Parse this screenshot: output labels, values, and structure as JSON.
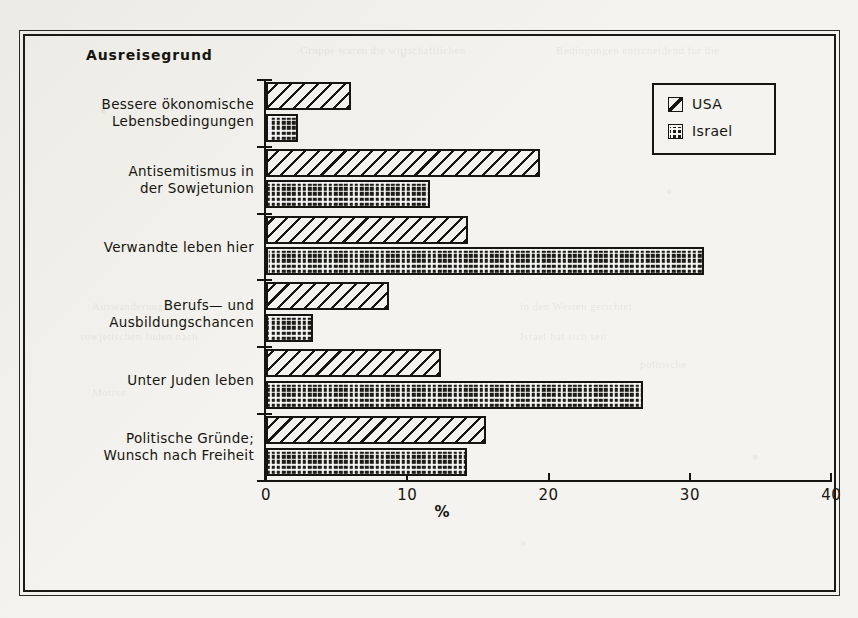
{
  "figure": {
    "title": "Ausreisegrund",
    "background_color": "#f4f3ef",
    "ink_color": "#16150f"
  },
  "legend": {
    "items": [
      {
        "label": "USA",
        "pattern": "diagonal-hatch",
        "swatch_name": "legend-swatch-usa"
      },
      {
        "label": "Israel",
        "pattern": "checkered-dot",
        "swatch_name": "legend-swatch-israel"
      }
    ]
  },
  "ghost_text": [
    {
      "text": "Gruppe waren die wirtschaftlichen",
      "x": 300,
      "y": 44
    },
    {
      "text": "Bedingungen entscheidend fur die",
      "x": 556,
      "y": 44
    },
    {
      "text": "Auswanderung",
      "x": 92,
      "y": 300
    },
    {
      "text": "in den Westen gerichtet",
      "x": 520,
      "y": 300
    },
    {
      "text": "sowjetischen Juden nach",
      "x": 80,
      "y": 330
    },
    {
      "text": "Israel hat sich seit",
      "x": 520,
      "y": 330
    },
    {
      "text": "politische",
      "x": 640,
      "y": 358
    },
    {
      "text": "Motive",
      "x": 92,
      "y": 386
    },
    {
      "text": "deutlich",
      "x": 560,
      "y": 386
    },
    {
      "text": "Familie",
      "x": 430,
      "y": 414
    }
  ],
  "chart_data": {
    "type": "bar",
    "orientation": "horizontal",
    "title": "Ausreisegrund",
    "xlabel": "%",
    "ylabel": "",
    "xlim": [
      0,
      40
    ],
    "xticks": [
      0,
      10,
      20,
      30,
      40
    ],
    "xtick_labels": [
      "0",
      "10",
      "20",
      "30",
      "40"
    ],
    "grid": false,
    "legend_position": "top-right",
    "categories": [
      "Bessere ökonomische\nLebensbedingungen",
      "Antisemitismus in\nder Sowjetunion",
      "Verwandte leben hier",
      "Berufs— und\nAusbildungschancen",
      "Unter Juden leben",
      "Politische Gründe;\nWunsch nach Freiheit"
    ],
    "series": [
      {
        "name": "USA",
        "values": [
          6.0,
          19.4,
          14.3,
          8.7,
          12.4,
          15.6
        ]
      },
      {
        "name": "Israel",
        "values": [
          2.3,
          11.6,
          31.0,
          3.3,
          26.7,
          14.2
        ]
      }
    ]
  }
}
